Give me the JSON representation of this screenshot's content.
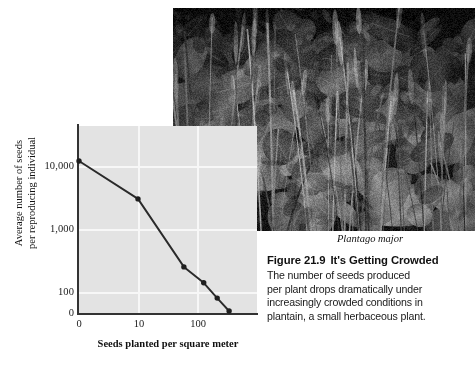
{
  "figure": {
    "species_label": "Plantago major",
    "caption_number": "Figure 21.9",
    "caption_title": "It's Getting Crowded",
    "caption_lines": [
      "The number of seeds produced",
      "per plant drops dramatically under",
      "increasingly crowded conditions in",
      "plantain, a small herbaceous plant."
    ],
    "photo_alt": "plantain-photo"
  },
  "colors": {
    "plot_background": "#e3e3e3",
    "gridline": "#f7f7f7",
    "axis": "#333333",
    "series": "#2a2a2a",
    "text": "#111111",
    "page_background": "#ffffff"
  },
  "chart_data": {
    "type": "line",
    "title": "",
    "xlabel": "Seeds planted per square meter",
    "ylabel": "Average number of seeds\nper reproducing individual",
    "ylabel_line1": "Average number of seeds",
    "ylabel_line2": "per reproducing individual",
    "yticks": [
      "0",
      "100",
      "1,000",
      "10,000"
    ],
    "ytick_values": [
      0,
      100,
      1000,
      10000
    ],
    "xticks": [
      "0",
      "10",
      "100"
    ],
    "xtick_values": [
      0,
      10,
      100
    ],
    "yscale": "log",
    "xscale": "log",
    "grid": true,
    "legend": "none",
    "x": [
      1,
      10,
      60,
      130,
      220,
      350
    ],
    "values": [
      12000,
      3000,
      250,
      140,
      80,
      50
    ],
    "points": [
      {
        "x": 1,
        "y": 12000
      },
      {
        "x": 10,
        "y": 3000
      },
      {
        "x": 60,
        "y": 250
      },
      {
        "x": 130,
        "y": 140
      },
      {
        "x": 220,
        "y": 80
      },
      {
        "x": 350,
        "y": 50
      }
    ],
    "pixel_points": [
      {
        "cx": 79,
        "cy": 166
      },
      {
        "cx": 126,
        "cy": 207
      },
      {
        "cx": 191,
        "cy": 276
      },
      {
        "cx": 212,
        "cy": 292
      },
      {
        "cx": 233,
        "cy": 308
      }
    ]
  }
}
